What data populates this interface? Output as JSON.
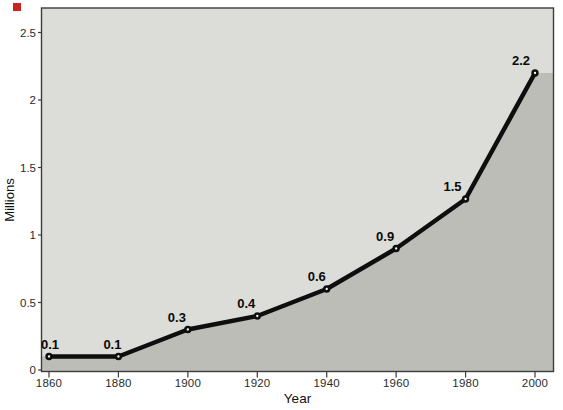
{
  "figure": {
    "corner_marker_color": "#c8251f"
  },
  "chart_data": {
    "type": "line",
    "title": "",
    "xlabel": "Year",
    "ylabel": "Millions",
    "x": [
      1860,
      1880,
      1900,
      1920,
      1940,
      1960,
      1980,
      2000
    ],
    "values": [
      0.1,
      0.1,
      0.3,
      0.4,
      0.6,
      0.9,
      1.5,
      2.2
    ],
    "point_labels": [
      "0.1",
      "0.1",
      "0.3",
      "0.4",
      "0.6",
      "0.9",
      "1.5",
      "2.2"
    ],
    "x_tick_labels": [
      "1860",
      "1880",
      "1900",
      "1920",
      "1940",
      "1960",
      "1980",
      "2000"
    ],
    "y_tick_labels": [
      "0",
      "0.5",
      "1",
      "1.5",
      "2",
      "2.5"
    ],
    "y_tick_values": [
      0,
      0.5,
      1,
      1.5,
      2,
      2.5
    ],
    "xlim": [
      1860,
      2000
    ],
    "ylim": [
      0,
      2.5
    ],
    "grid": false,
    "legend": "none",
    "area_fill_under_line": true,
    "marker_style": "black dot with white center",
    "colors": {
      "line": "#0e0e0e",
      "area_fill": "#bdbdb8",
      "plot_background": "#dcdcd8",
      "border": "#3c3c3c",
      "marker": "#0e0e0e",
      "marker_center": "#ffffff",
      "tick_text": "#2b2b2b",
      "label_text": "#0a0a0a"
    }
  }
}
